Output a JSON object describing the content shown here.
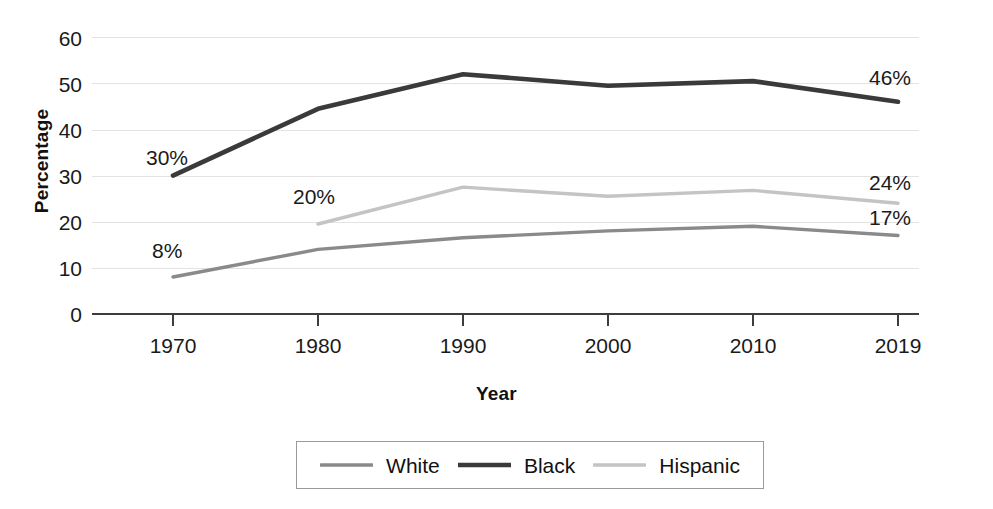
{
  "chart_data": {
    "type": "line",
    "title": "",
    "xlabel": "Year",
    "ylabel": "Percentage",
    "categories": [
      "1970",
      "1980",
      "1990",
      "2000",
      "2010",
      "2019"
    ],
    "ylim": [
      0,
      60
    ],
    "yticks": [
      "60",
      "50",
      "40",
      "30",
      "20",
      "10",
      "0"
    ],
    "grid": true,
    "legend_position": "bottom",
    "series": [
      {
        "name": "White",
        "color": "#8a8a8a",
        "values": [
          8,
          14,
          16.5,
          18,
          19,
          17
        ]
      },
      {
        "name": "Black",
        "color": "#3a3a3a",
        "values": [
          30,
          44.5,
          52,
          49.5,
          50.5,
          46
        ]
      },
      {
        "name": "Hispanic",
        "color": "#c4c4c4",
        "values": [
          null,
          19.5,
          27.5,
          25.5,
          26.8,
          24
        ]
      }
    ],
    "annotations": [
      {
        "text": "30%",
        "series": "Black",
        "category": "1970"
      },
      {
        "text": "8%",
        "series": "White",
        "category": "1970"
      },
      {
        "text": "20%",
        "series": "Hispanic",
        "category": "1980"
      },
      {
        "text": "46%",
        "series": "Black",
        "category": "2019"
      },
      {
        "text": "24%",
        "series": "Hispanic",
        "category": "2019"
      },
      {
        "text": "17%",
        "series": "White",
        "category": "2019"
      }
    ]
  },
  "axes": {
    "y_title": "Percentage",
    "x_title": "Year",
    "y_ticks": [
      "60",
      "50",
      "40",
      "30",
      "20",
      "10",
      "0"
    ],
    "x_ticks": [
      "1970",
      "1980",
      "1990",
      "2000",
      "2010",
      "2019"
    ]
  },
  "labels": {
    "black_1970": "30%",
    "white_1970": "8%",
    "hispanic_1980": "20%",
    "black_2019": "46%",
    "hispanic_2019": "24%",
    "white_2019": "17%"
  },
  "legend": {
    "items": [
      {
        "label": "White",
        "color": "#8a8a8a"
      },
      {
        "label": "Black",
        "color": "#3a3a3a"
      },
      {
        "label": "Hispanic",
        "color": "#c4c4c4"
      }
    ]
  }
}
